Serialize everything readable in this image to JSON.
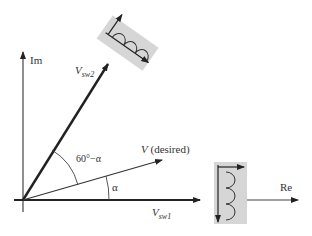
{
  "axes": {
    "x_label": "Re",
    "y_label": "Im"
  },
  "vectors": {
    "vsw1": {
      "main": "V",
      "sub": "sw1"
    },
    "vsw2": {
      "main": "V",
      "sub": "sw2"
    },
    "vdesired": {
      "main": "V",
      "rest": " (desired)"
    }
  },
  "angles": {
    "alpha": "α",
    "sixty_minus_alpha": "60°−α"
  },
  "colors": {
    "inductor_box": "#d6d6d6",
    "line": "#222222"
  }
}
